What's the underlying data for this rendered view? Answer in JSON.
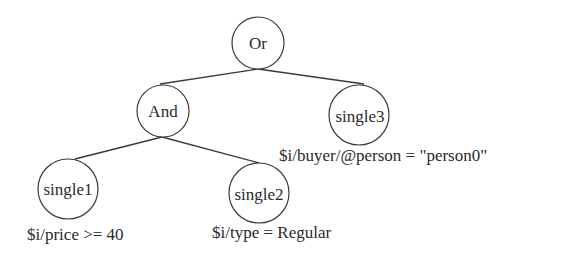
{
  "diagram": {
    "type": "tree",
    "nodes": {
      "or": {
        "label": "Or"
      },
      "and": {
        "label": "And"
      },
      "single1": {
        "label": "single1",
        "condition": "$i/price >= 40"
      },
      "single2": {
        "label": "single2",
        "condition": "$i/type = Regular"
      },
      "single3": {
        "label": "single3",
        "condition": "$i/buyer/@person = \"person0\""
      }
    },
    "edges": [
      {
        "from": "Or",
        "to": "And"
      },
      {
        "from": "Or",
        "to": "single3"
      },
      {
        "from": "And",
        "to": "single1"
      },
      {
        "from": "And",
        "to": "single2"
      }
    ]
  }
}
